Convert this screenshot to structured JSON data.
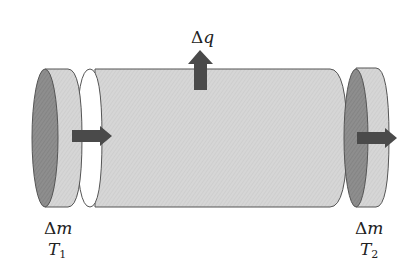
{
  "diagram": {
    "type": "control-volume-cylinder",
    "labels": {
      "heat": {
        "delta": "Δ",
        "symbol": "q"
      },
      "mass_in": {
        "delta": "Δ",
        "symbol": "m",
        "temp_symbol": "T",
        "temp_sub": "1"
      },
      "mass_out": {
        "delta": "Δ",
        "symbol": "m",
        "temp_symbol": "T",
        "temp_sub": "2"
      }
    },
    "colors": {
      "cylinder_fill": "#d4d4d4",
      "disc_face_dark": "#8a8a8a",
      "disc_band": "#d0d0d0",
      "arrow": "#4a4a4a",
      "outline": "#555555",
      "background": "#ffffff"
    }
  }
}
